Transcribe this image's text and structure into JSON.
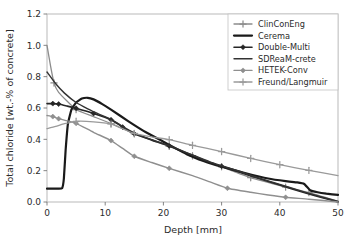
{
  "chart_data": {
    "type": "line",
    "title": "",
    "xlabel": "Depth [mm]",
    "ylabel": "Total chloride [wt.-% of concrete]",
    "xlim": [
      0,
      50
    ],
    "ylim": [
      0.0,
      1.2
    ],
    "xticks": [
      0,
      10,
      20,
      30,
      40,
      50
    ],
    "xtick_labels": [
      "0",
      "10",
      "20",
      "30",
      "40",
      "50"
    ],
    "yticks": [
      0.0,
      0.2,
      0.4,
      0.6,
      0.8,
      1.0,
      1.2
    ],
    "ytick_labels": [
      "0.0",
      "0.2",
      "0.4",
      "0.6",
      "0.8",
      "1.0",
      "1.2"
    ],
    "grid": false,
    "legend_position": "upper right",
    "series": [
      {
        "name": "ClinConEng",
        "color": "#8c8c8c",
        "marker": "plus",
        "linewidth": 1.3,
        "x": [
          0,
          0.6,
          1.2,
          2.0,
          5.0,
          8.0,
          11.0,
          15.0,
          18.0,
          21.0,
          25.0,
          30.0,
          35.0,
          41.0,
          45.0,
          50.0
        ],
        "y": [
          1.0,
          0.87,
          0.76,
          0.7,
          0.59,
          0.545,
          0.5,
          0.435,
          0.395,
          0.355,
          0.295,
          0.225,
          0.155,
          0.095,
          0.06,
          0.005
        ],
        "marker_x": [
          1.2,
          5.0,
          11.0,
          15.0,
          21.0,
          25.0,
          30.0,
          35.0,
          41.0,
          45.0
        ],
        "marker_y": [
          0.76,
          0.59,
          0.5,
          0.435,
          0.355,
          0.295,
          0.225,
          0.155,
          0.095,
          0.06
        ]
      },
      {
        "name": "Cerema",
        "color": "#1a1a1a",
        "marker": "none",
        "linewidth": 2.2,
        "x": [
          0,
          1.0,
          2.0,
          2.6,
          2.9,
          3.2,
          3.6,
          4.2,
          5.0,
          6.0,
          7.0,
          8.0,
          9.5,
          11.0,
          14.0,
          17.0,
          20.0,
          24.0,
          27.0,
          30.0,
          34.0,
          38.0,
          41.0,
          43.0,
          44.2,
          45.2,
          46.5,
          48.0,
          50.0
        ],
        "y": [
          0.085,
          0.085,
          0.085,
          0.088,
          0.15,
          0.33,
          0.5,
          0.59,
          0.635,
          0.66,
          0.665,
          0.655,
          0.625,
          0.59,
          0.515,
          0.445,
          0.385,
          0.305,
          0.26,
          0.225,
          0.185,
          0.15,
          0.133,
          0.125,
          0.115,
          0.075,
          0.062,
          0.053,
          0.045
        ],
        "marker_x": [],
        "marker_y": []
      },
      {
        "name": "Double-Multi",
        "color": "#262626",
        "marker": "diamond",
        "linewidth": 1.6,
        "x": [
          0,
          1.0,
          2.0,
          3.5,
          5.0,
          8.0,
          11.0,
          13.0,
          15.0,
          18.0,
          21.0,
          25.0,
          28.0,
          30.0,
          33.0,
          36.0,
          40.0,
          44.0,
          47.0,
          50.0
        ],
        "y": [
          0.628,
          0.628,
          0.625,
          0.612,
          0.598,
          0.565,
          0.525,
          0.478,
          0.435,
          0.395,
          0.358,
          0.298,
          0.252,
          0.228,
          0.192,
          0.155,
          0.108,
          0.062,
          0.03,
          0.0
        ],
        "marker_x": [
          1.0,
          2.0,
          5.0,
          8.0,
          11.0,
          13.0,
          15.0,
          21.0,
          30.0
        ],
        "marker_y": [
          0.628,
          0.625,
          0.598,
          0.565,
          0.525,
          0.478,
          0.435,
          0.358,
          0.228
        ]
      },
      {
        "name": "SDReaM-crete",
        "color": "#333333",
        "marker": "none",
        "linewidth": 1.4,
        "x": [
          0,
          1.5,
          3.0,
          5.0,
          7.0,
          9.0,
          11.0,
          13.0,
          15.0,
          18.0,
          21.0,
          25.0,
          28.0,
          30.0,
          33.0,
          36.0,
          40.0,
          44.0,
          47.0,
          50.0
        ],
        "y": [
          0.83,
          0.755,
          0.695,
          0.635,
          0.595,
          0.56,
          0.528,
          0.482,
          0.44,
          0.398,
          0.36,
          0.3,
          0.256,
          0.232,
          0.196,
          0.158,
          0.112,
          0.066,
          0.034,
          0.004
        ],
        "marker_x": [],
        "marker_y": []
      },
      {
        "name": "HETEK-Conv",
        "color": "#8f8f8f",
        "marker": "diamond",
        "linewidth": 1.4,
        "x": [
          0,
          1.0,
          2.0,
          3.5,
          5.0,
          8.0,
          11.0,
          13.0,
          15.0,
          18.0,
          21.0,
          25.0,
          28.0,
          31.0,
          35.0,
          38.0,
          41.0,
          45.0,
          50.0
        ],
        "y": [
          0.552,
          0.545,
          0.532,
          0.518,
          0.502,
          0.445,
          0.392,
          0.342,
          0.292,
          0.252,
          0.215,
          0.168,
          0.128,
          0.088,
          0.062,
          0.045,
          0.03,
          0.018,
          0.0
        ],
        "marker_x": [
          1.0,
          2.0,
          5.0,
          11.0,
          15.0,
          21.0,
          31.0,
          41.0
        ],
        "marker_y": [
          0.545,
          0.532,
          0.502,
          0.392,
          0.292,
          0.215,
          0.088,
          0.03
        ]
      },
      {
        "name": "Freund/Langmuir",
        "color": "#9a9a9a",
        "marker": "plus",
        "linewidth": 1.3,
        "x": [
          0,
          1.5,
          3.0,
          5.0,
          8.0,
          11.0,
          13.0,
          15.0,
          18.0,
          21.0,
          25.0,
          30.0,
          35.0,
          40.0,
          45.0,
          50.0
        ],
        "y": [
          0.468,
          0.482,
          0.5,
          0.515,
          0.512,
          0.498,
          0.468,
          0.438,
          0.415,
          0.398,
          0.362,
          0.322,
          0.278,
          0.238,
          0.202,
          0.168
        ],
        "marker_x": [
          5.0,
          11.0,
          15.0,
          21.0,
          25.0,
          30.0,
          35.0,
          40.0,
          45.0
        ],
        "marker_y": [
          0.515,
          0.498,
          0.438,
          0.398,
          0.362,
          0.322,
          0.278,
          0.238,
          0.202
        ]
      }
    ]
  },
  "legend": {
    "entries": [
      {
        "label": "ClinConEng"
      },
      {
        "label": "Cerema"
      },
      {
        "label": "Double-Multi"
      },
      {
        "label": "SDReaM-crete"
      },
      {
        "label": "HETEK-Conv"
      },
      {
        "label": "Freund/Langmuir"
      }
    ]
  },
  "axes": {
    "x_title": "Depth [mm]",
    "y_title": "Total chloride [wt.-% of concrete]"
  }
}
